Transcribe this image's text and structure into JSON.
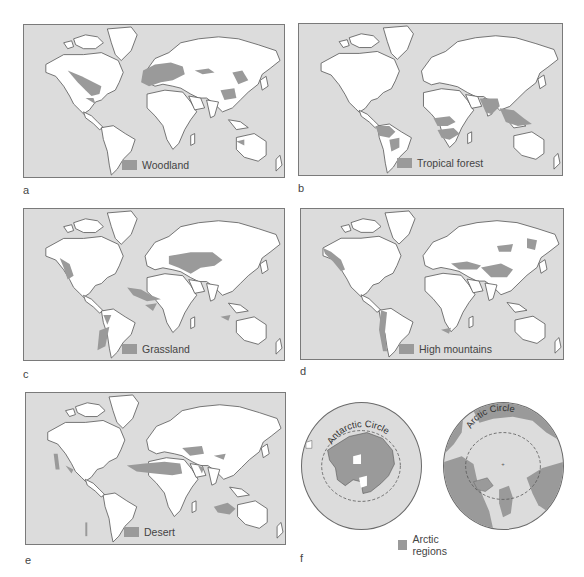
{
  "figure": {
    "panels": [
      {
        "id": "a",
        "label": "a",
        "legend": "Woodland",
        "region": "woodland"
      },
      {
        "id": "b",
        "label": "b",
        "legend": "Tropical forest",
        "region": "tropical-forest"
      },
      {
        "id": "c",
        "label": "c",
        "legend": "Grassland",
        "region": "grassland"
      },
      {
        "id": "d",
        "label": "d",
        "legend": "High mountains",
        "region": "high-mountains"
      },
      {
        "id": "e",
        "label": "e",
        "legend": "Desert",
        "region": "desert"
      },
      {
        "id": "f",
        "label": "f",
        "legend": "Arctic regions",
        "region": "arctic-regions",
        "circle_labels": {
          "south": "Antarctic Circle",
          "north": "Arctic Circle"
        }
      }
    ],
    "colors": {
      "ocean": "#dcdcdc",
      "land": "#ffffff",
      "highlight": "#9a9a9a",
      "coastline": "#555555",
      "frame": "#7a7a7a"
    }
  }
}
